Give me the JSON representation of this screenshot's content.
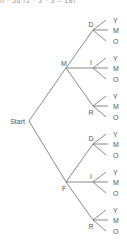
{
  "top_text": "n · 56 (2 · 3 · 3 = 18)",
  "tree": {
    "root": "Start",
    "level1": [
      "M",
      "F"
    ],
    "level2": [
      "D",
      "I",
      "R"
    ],
    "level3": [
      "Y",
      "M",
      "O"
    ]
  }
}
